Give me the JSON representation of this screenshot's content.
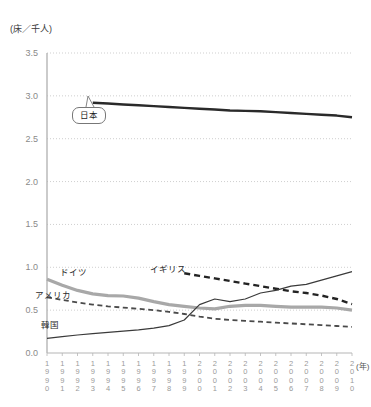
{
  "chart_data": {
    "type": "line",
    "title": "",
    "subtitle": "",
    "unit_label": "(床／千人)",
    "xlabel": "(年)",
    "ylabel": "",
    "ylim": [
      0.0,
      3.5
    ],
    "xlim": [
      1990,
      2010
    ],
    "grid": true,
    "grid_axis": "y",
    "legend_position": "inline-annotations",
    "ytick_labels": [
      "0.0",
      "0.5",
      "1.0",
      "1.5",
      "2.0",
      "2.5",
      "3.0",
      "3.5"
    ],
    "ytick_values": [
      0.0,
      0.5,
      1.0,
      1.5,
      2.0,
      2.5,
      3.0,
      3.5
    ],
    "categories": [
      1990,
      1991,
      1992,
      1993,
      1994,
      1995,
      1996,
      1997,
      1998,
      1999,
      2000,
      2001,
      2002,
      2003,
      2004,
      2005,
      2006,
      2007,
      2008,
      2009,
      2010
    ],
    "xtick_labels": [
      [
        "1",
        "9",
        "9",
        "0"
      ],
      [
        "1",
        "9",
        "9",
        "1"
      ],
      [
        "1",
        "9",
        "9",
        "2"
      ],
      [
        "1",
        "9",
        "9",
        "3"
      ],
      [
        "1",
        "9",
        "9",
        "4"
      ],
      [
        "1",
        "9",
        "9",
        "5"
      ],
      [
        "1",
        "9",
        "9",
        "6"
      ],
      [
        "1",
        "9",
        "9",
        "7"
      ],
      [
        "1",
        "9",
        "9",
        "8"
      ],
      [
        "1",
        "9",
        "9",
        "9"
      ],
      [
        "2",
        "0",
        "0",
        "0"
      ],
      [
        "2",
        "0",
        "0",
        "1"
      ],
      [
        "2",
        "0",
        "0",
        "2"
      ],
      [
        "2",
        "0",
        "0",
        "3"
      ],
      [
        "2",
        "0",
        "0",
        "4"
      ],
      [
        "2",
        "0",
        "0",
        "5"
      ],
      [
        "2",
        "0",
        "0",
        "6"
      ],
      [
        "2",
        "0",
        "0",
        "7"
      ],
      [
        "2",
        "0",
        "0",
        "8"
      ],
      [
        "2",
        "0",
        "0",
        "9"
      ],
      [
        "2",
        "0",
        "1",
        "0"
      ]
    ],
    "series": [
      {
        "name": "日本",
        "label": "日本",
        "style": "solid-thick",
        "color": "#2a2a2a",
        "label_kind": "callout",
        "start_index": 3,
        "values": [
          null,
          null,
          null,
          2.92,
          2.91,
          2.9,
          2.89,
          2.88,
          2.87,
          2.86,
          2.85,
          2.84,
          2.83,
          2.825,
          2.82,
          2.81,
          2.8,
          2.79,
          2.78,
          2.77,
          2.75
        ]
      },
      {
        "name": "ドイツ",
        "label": "ドイツ",
        "style": "solid-thick-gray",
        "color": "#a8a8a8",
        "label_kind": "inline",
        "start_index": 0,
        "values": [
          0.86,
          0.79,
          0.73,
          0.69,
          0.67,
          0.665,
          0.64,
          0.6,
          0.565,
          0.545,
          0.525,
          0.515,
          0.545,
          0.555,
          0.555,
          0.545,
          0.535,
          0.535,
          0.535,
          0.525,
          0.5
        ]
      },
      {
        "name": "イギリス",
        "label": "イギリス",
        "style": "dashed-thick",
        "color": "#232323",
        "label_kind": "inline",
        "start_index": 9,
        "values": [
          null,
          null,
          null,
          null,
          null,
          null,
          null,
          null,
          null,
          0.93,
          0.9,
          0.87,
          0.84,
          0.81,
          0.78,
          0.75,
          0.72,
          0.7,
          0.67,
          0.63,
          0.57
        ]
      },
      {
        "name": "アメリカ",
        "label": "アメリカ",
        "style": "dashed-thin",
        "color": "#4a4a4a",
        "label_kind": "inline",
        "start_index": 0,
        "values": [
          0.65,
          0.62,
          0.59,
          0.565,
          0.545,
          0.53,
          0.515,
          0.5,
          0.48,
          0.455,
          0.425,
          0.4,
          0.385,
          0.375,
          0.365,
          0.355,
          0.345,
          0.335,
          0.325,
          0.315,
          0.305
        ]
      },
      {
        "name": "韓国",
        "label": "韓国",
        "style": "solid-thin",
        "color": "#3a3a3a",
        "label_kind": "inline",
        "start_index": 0,
        "values": [
          0.17,
          0.19,
          0.21,
          0.225,
          0.24,
          0.255,
          0.27,
          0.29,
          0.32,
          0.385,
          0.565,
          0.63,
          0.6,
          0.63,
          0.7,
          0.73,
          0.78,
          0.8,
          0.85,
          0.9,
          0.95
        ]
      }
    ],
    "annotations": [
      {
        "text": "日本",
        "kind": "callout",
        "x": 1993,
        "y": 2.92
      },
      {
        "text": "ドイツ",
        "kind": "inline",
        "x": 1992,
        "y": 0.95
      },
      {
        "text": "アメリカ",
        "kind": "inline",
        "x": 1990,
        "y": 0.72
      },
      {
        "text": "イギリス",
        "kind": "inline",
        "x": 1999,
        "y": 0.98
      },
      {
        "text": "韓国",
        "kind": "inline",
        "x": 1990.5,
        "y": 0.33
      }
    ]
  },
  "colors": {
    "japan": "#2a2a2a",
    "germany": "#a8a8a8",
    "uk": "#232323",
    "usa": "#4a4a4a",
    "korea": "#3a3a3a",
    "grid": "#cfcfcf",
    "axis": "#b5b5b5",
    "tick_text": "#9a9a9a"
  }
}
